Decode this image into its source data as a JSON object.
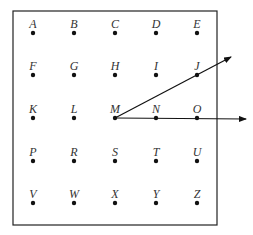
{
  "diagram": {
    "frame": {
      "x": 13,
      "y": 11,
      "width": 204,
      "height": 214
    },
    "colors": {
      "ink": "#111111",
      "label": "#333333",
      "background": "#ffffff"
    },
    "columns_x": [
      33,
      74,
      115,
      156,
      197
    ],
    "rows_y": [
      33,
      75,
      118,
      161,
      203
    ],
    "rows": [
      [
        "A",
        "B",
        "C",
        "D",
        "E"
      ],
      [
        "F",
        "G",
        "H",
        "I",
        "J"
      ],
      [
        "K",
        "L",
        "M",
        "N",
        "O"
      ],
      [
        "P",
        "R",
        "S",
        "T",
        "U"
      ],
      [
        "V",
        "W",
        "X",
        "Y",
        "Z"
      ]
    ],
    "rays": [
      {
        "name": "ray-MJ",
        "from": "M",
        "through": "J",
        "end": [
          231,
          57
        ]
      },
      {
        "name": "ray-MO",
        "from": "M",
        "through": "O",
        "end": [
          246,
          119
        ]
      }
    ]
  }
}
